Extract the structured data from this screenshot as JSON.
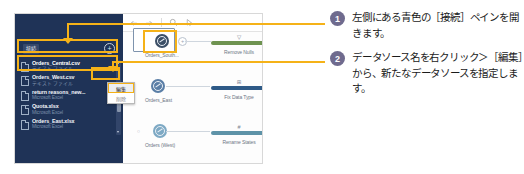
{
  "app": {
    "connections_pane": {
      "title": "接続",
      "add_button_icon": "plus-circle-icon",
      "files": [
        {
          "name": "Orders_Central.csv",
          "type": "テキスト ファイル",
          "selected": true
        },
        {
          "name": "Orders_West.csv",
          "type": "テキスト ファイル",
          "selected": false
        },
        {
          "name": "return reasons_new...",
          "type": "Microsoft Excel",
          "selected": false
        },
        {
          "name": "Quota.xlsx",
          "type": "Microsoft Excel",
          "selected": false
        },
        {
          "name": "Orders_East.xlsx",
          "type": "Microsoft Excel",
          "selected": false
        }
      ]
    },
    "context_menu": {
      "items": [
        {
          "label": "編集",
          "highlighted": true
        },
        {
          "label": "削除",
          "highlighted": false
        }
      ]
    },
    "toolbar": {
      "icons": [
        "undo-icon",
        "redo-icon",
        "search-icon",
        "pointer-icon"
      ]
    },
    "flow": {
      "rows": [
        {
          "node_label": "Orders_South...",
          "node_style": "dark",
          "selected": true,
          "has_plus": true,
          "prefix_dot": "",
          "step_label": "Remove Nulls",
          "step_color_name": "green",
          "step_icon": "▽"
        },
        {
          "node_label": "Orders_East",
          "node_style": "light",
          "selected": false,
          "has_plus": false,
          "prefix_dot": "",
          "step_label": "Fix Data Type",
          "step_color_name": "navy",
          "step_icon": "⊞"
        },
        {
          "node_label": "Orders (West)",
          "node_style": "pale",
          "selected": false,
          "has_plus": false,
          "prefix_dot": "○",
          "step_label": "Rename States",
          "step_color_name": "teal",
          "step_icon": "#"
        }
      ]
    }
  },
  "annotations": [
    {
      "number": "1",
      "text": "左側にある青色の［接続］ペインを開きます。"
    },
    {
      "number": "2",
      "text": "データソース名を右クリック＞［編集］から、新たなデータソースを指定します。"
    }
  ],
  "colors": {
    "highlight": "#f5b218",
    "pane_background": "#1f3357",
    "badge": "#6f6b8e",
    "step_green": "#6e9350",
    "step_navy": "#2e5a87",
    "step_teal": "#5e93a8"
  }
}
